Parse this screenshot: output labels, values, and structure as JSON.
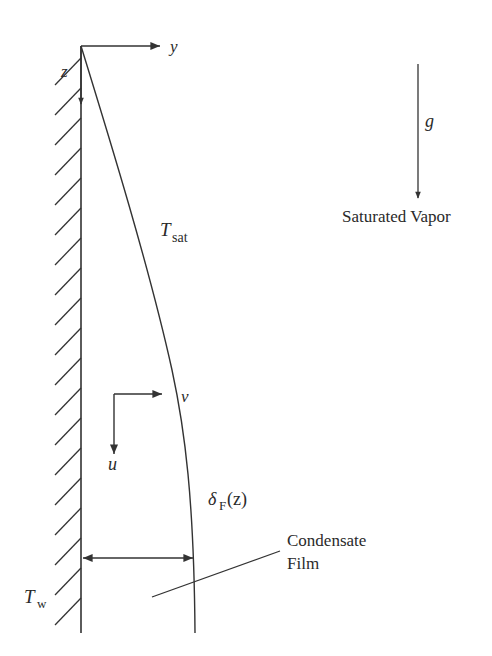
{
  "diagram": {
    "labels": {
      "y_axis": "y",
      "z_axis": "z",
      "gravity": "g",
      "saturated_vapor": "Saturated Vapor",
      "t_sat_main": "T",
      "t_sat_sub": "sat",
      "v_velocity": "v",
      "u_velocity": "u",
      "delta_main": "δ",
      "delta_sub": "F",
      "delta_arg": "(z)",
      "condensate_line1": "Condensate",
      "condensate_line2": "Film",
      "t_wall_main": "T",
      "t_wall_sub": "w"
    },
    "colors": {
      "ink": "#333333",
      "background": "#ffffff"
    }
  }
}
